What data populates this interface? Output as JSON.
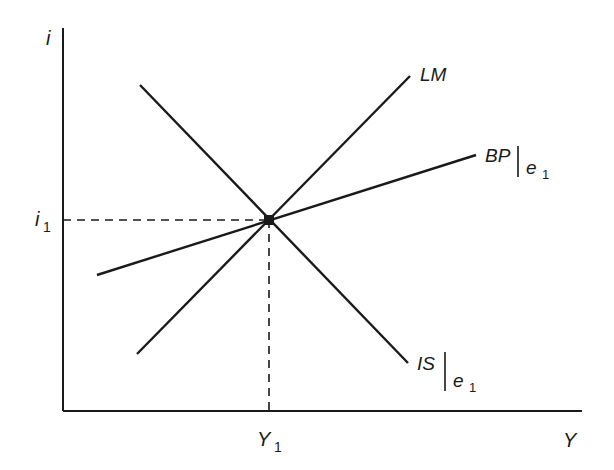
{
  "diagram": {
    "type": "IS-LM-BP economics diagram",
    "axes": {
      "y_axis_label": "i",
      "x_axis_label": "Y"
    },
    "equilibrium": {
      "interest_label": "i",
      "interest_subscript": "1",
      "output_label": "Y",
      "output_subscript": "1"
    },
    "curves": [
      {
        "id": "LM",
        "label": "LM",
        "qualifier": "",
        "qualifier_subscript": "",
        "slope": "upward"
      },
      {
        "id": "BP",
        "label": "BP",
        "qualifier": "e",
        "qualifier_subscript": "1",
        "slope": "upward-flat"
      },
      {
        "id": "IS",
        "label": "IS",
        "qualifier": "e",
        "qualifier_subscript": "1",
        "slope": "downward"
      }
    ],
    "colors": {
      "line": "#1a1a1a",
      "background": "#ffffff"
    }
  }
}
